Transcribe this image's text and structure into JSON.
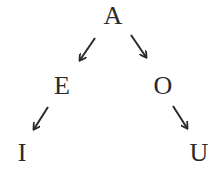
{
  "diagram": {
    "type": "tree",
    "nodes": [
      {
        "id": "A",
        "label": "A",
        "x": 113,
        "y": 16
      },
      {
        "id": "E",
        "label": "E",
        "x": 62,
        "y": 86
      },
      {
        "id": "O",
        "label": "O",
        "x": 163,
        "y": 86
      },
      {
        "id": "I",
        "label": "I",
        "x": 22,
        "y": 153
      },
      {
        "id": "U",
        "label": "U",
        "x": 199,
        "y": 153
      }
    ],
    "edges": [
      {
        "from": "A",
        "to": "E"
      },
      {
        "from": "A",
        "to": "O"
      },
      {
        "from": "E",
        "to": "I"
      },
      {
        "from": "O",
        "to": "U"
      }
    ],
    "colors": {
      "text": "#2a2a2a",
      "arrow": "#2a2a2a",
      "background": "#ffffff"
    }
  }
}
